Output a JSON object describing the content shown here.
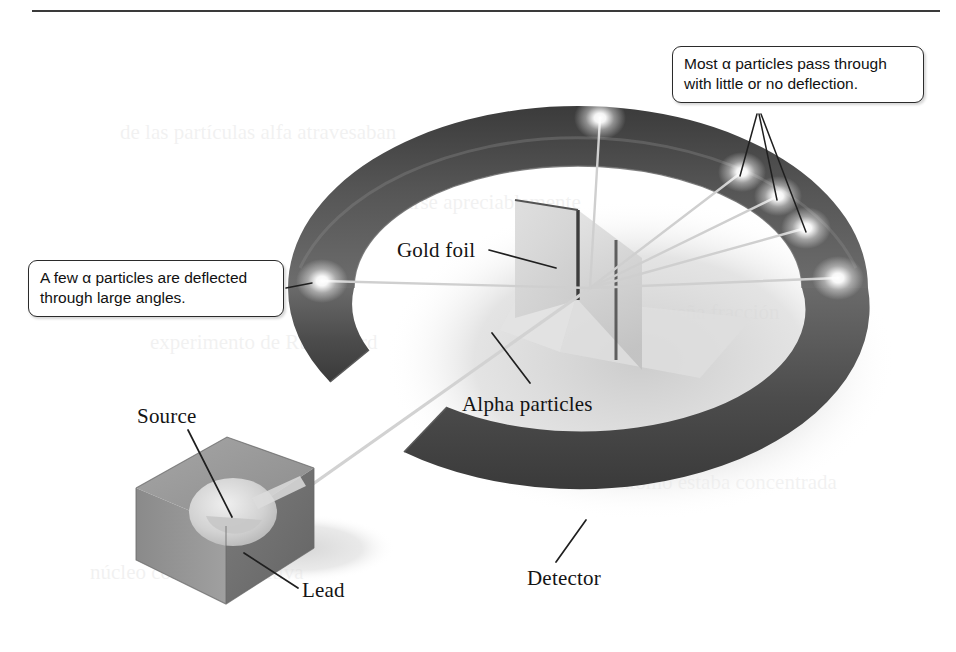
{
  "figure": {
    "top_rule": true
  },
  "callouts": [
    {
      "id": "most",
      "text": "Most α particles pass through\nwith little or no deflection.",
      "text_plain": "Most α particles pass through with little or no deflection."
    },
    {
      "id": "few",
      "text": "A few α particles are deflected\nthrough large angles.",
      "text_plain": "A few α particles are deflected through large angles."
    }
  ],
  "labels": {
    "gold_foil": "Gold foil",
    "alpha_particles": "Alpha particles",
    "source": "Source",
    "lead": "Lead",
    "detector": "Detector"
  },
  "components": {
    "detector_ring": "circular fluorescent screen detector",
    "gold_foil_sheet": "thin gold foil target",
    "lead_block": "lead shielding block with cavity",
    "alpha_source": "radioactive alpha particle source",
    "beam": "collimated alpha particle beam",
    "flashes": "scintillation flash points on detector"
  },
  "colors": {
    "ring_dark": "#4a4a4a",
    "ring_darkest": "#2e2e2e",
    "ring_light": "#8f8f8f",
    "foil": "#cfcfcf",
    "lead_block": "#9a9a9a",
    "lead_block_dark": "#6f6f6f",
    "beam": "#d8d8d8",
    "leader_line": "#1f1f1f",
    "rule": "#3a3a3a",
    "shadow": "#d9d9d9"
  },
  "bleed_text": [
    "de las partículas alfa atravesaban",
    "sin desviarse apreciablemente",
    "experimento de Rutherford",
    "una pequeña fracción",
    "átomo estaba concentrada",
    "núcleo con carga positiva"
  ]
}
